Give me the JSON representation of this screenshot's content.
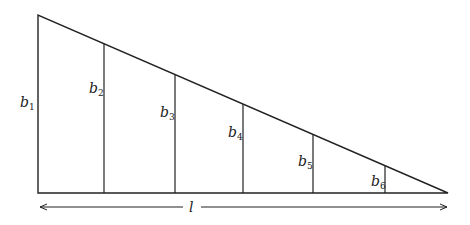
{
  "diagram": {
    "type": "right-triangle-strip-division",
    "triangle": {
      "apex": [
        38,
        15
      ],
      "base_left": [
        38,
        193
      ],
      "base_right": [
        448,
        193
      ]
    },
    "verticals": [
      {
        "label": "b",
        "sub": "1",
        "x": 38,
        "label_x": 20,
        "label_y": 107
      },
      {
        "label": "b",
        "sub": "2",
        "x": 104,
        "label_x": 89,
        "label_y": 93
      },
      {
        "label": "b",
        "sub": "3",
        "x": 175,
        "label_x": 160,
        "label_y": 117
      },
      {
        "label": "b",
        "sub": "4",
        "x": 243,
        "label_x": 228,
        "label_y": 137
      },
      {
        "label": "b",
        "sub": "5",
        "x": 313,
        "label_x": 298,
        "label_y": 166
      },
      {
        "label": "b",
        "sub": "6",
        "x": 385,
        "label_x": 371,
        "label_y": 186
      }
    ],
    "length_arrow": {
      "label": "l",
      "y": 207,
      "x1": 40,
      "x2": 447,
      "label_x": 191
    },
    "colors": {
      "line": "#222222",
      "background": "#ffffff"
    }
  }
}
